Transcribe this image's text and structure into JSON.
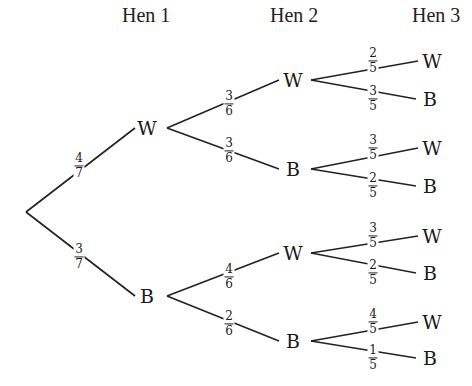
{
  "headers": [
    "Hen 1",
    "Hen 2",
    "Hen 3"
  ],
  "tree": {
    "root": {
      "x": 26,
      "y": 212
    },
    "level1": [
      {
        "label": "W",
        "x": 147,
        "y": 128,
        "prob": {
          "num": "4",
          "den": "7"
        },
        "px": 79,
        "py": 166
      },
      {
        "label": "B",
        "x": 147,
        "y": 296,
        "prob": {
          "num": "3",
          "den": "7"
        },
        "px": 79,
        "py": 257
      }
    ],
    "level2": [
      {
        "parent": 0,
        "label": "W",
        "x": 293,
        "y": 80,
        "prob": {
          "num": "3",
          "den": "6"
        },
        "px": 229,
        "py": 104
      },
      {
        "parent": 0,
        "label": "B",
        "x": 293,
        "y": 169,
        "prob": {
          "num": "3",
          "den": "6"
        },
        "px": 229,
        "py": 151
      },
      {
        "parent": 1,
        "label": "W",
        "x": 293,
        "y": 253,
        "prob": {
          "num": "4",
          "den": "6"
        },
        "px": 229,
        "py": 277
      },
      {
        "parent": 1,
        "label": "B",
        "x": 293,
        "y": 341,
        "prob": {
          "num": "2",
          "den": "6"
        },
        "px": 229,
        "py": 324
      }
    ],
    "level3": [
      {
        "parent": 0,
        "label": "W",
        "x": 432,
        "y": 61,
        "prob": {
          "num": "2",
          "den": "5"
        },
        "px": 373,
        "py": 61
      },
      {
        "parent": 0,
        "label": "B",
        "x": 430,
        "y": 99,
        "prob": {
          "num": "3",
          "den": "5"
        },
        "px": 373,
        "py": 99
      },
      {
        "parent": 1,
        "label": "W",
        "x": 432,
        "y": 148,
        "prob": {
          "num": "3",
          "den": "5"
        },
        "px": 373,
        "py": 148
      },
      {
        "parent": 1,
        "label": "B",
        "x": 430,
        "y": 186,
        "prob": {
          "num": "2",
          "den": "5"
        },
        "px": 373,
        "py": 186
      },
      {
        "parent": 2,
        "label": "W",
        "x": 432,
        "y": 236,
        "prob": {
          "num": "3",
          "den": "5"
        },
        "px": 373,
        "py": 236
      },
      {
        "parent": 2,
        "label": "B",
        "x": 430,
        "y": 273,
        "prob": {
          "num": "2",
          "den": "5"
        },
        "px": 373,
        "py": 273
      },
      {
        "parent": 3,
        "label": "W",
        "x": 432,
        "y": 322,
        "prob": {
          "num": "4",
          "den": "5"
        },
        "px": 373,
        "py": 322
      },
      {
        "parent": 3,
        "label": "B",
        "x": 430,
        "y": 358,
        "prob": {
          "num": "1",
          "den": "5"
        },
        "px": 373,
        "py": 358
      }
    ]
  }
}
